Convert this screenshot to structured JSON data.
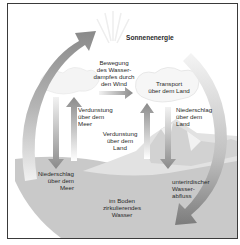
{
  "diagram": {
    "title": "Sonnenenergie",
    "labels": {
      "wind_transport": "Bewegung\ndes Wasser-\ndampfes durch\nden Wind",
      "transport_land": "Transport\nüber dem Land",
      "evap_sea": "Verdunstung\nüber dem\nMeer",
      "evap_land": "Verdunstung\nüber dem\nLand",
      "precip_land": "Niederschlag\nüber dem\nLand",
      "precip_sea": "Niederschlag\nüber dem\nMeer",
      "underground_runoff": "unterirdischer\nWasser-\nabfluss",
      "soil_water": "im Boden\nzirkulierendes\nWasser"
    },
    "colors": {
      "arrow": "#8a8a8a",
      "arrow_light": "#d4d4d4",
      "sea": "#c8c8c8",
      "land": "#e4e4e4",
      "border": "#3a3a3a"
    }
  }
}
